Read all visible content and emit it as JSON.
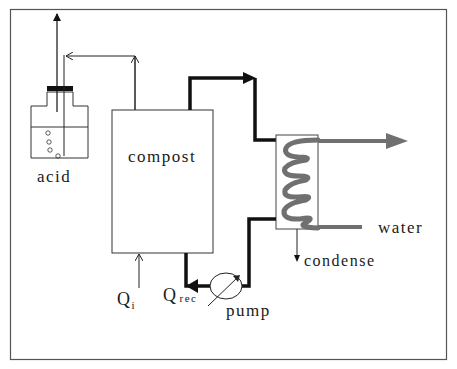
{
  "diagram": {
    "labels": {
      "acid": "acid",
      "compost": "compost",
      "water": "water",
      "condense": "condense",
      "pump": "pump",
      "q_rec_main": "Q",
      "q_rec_sub": "rec",
      "q_i_main": "Q",
      "q_i_sub": "i"
    },
    "colors": {
      "line": "#111111",
      "thin_line": "#333333",
      "coil": "#707070",
      "frame": "#555555"
    },
    "components": [
      {
        "id": "acid-trap",
        "name": "acid"
      },
      {
        "id": "compost-reactor",
        "name": "compost"
      },
      {
        "id": "condenser",
        "name": "condenser coil"
      },
      {
        "id": "pump",
        "name": "pump"
      }
    ],
    "flows": [
      {
        "from": "Q_i",
        "to": "compost-reactor"
      },
      {
        "from": "compost-reactor",
        "to": "acid-trap"
      },
      {
        "from": "acid-trap",
        "to": "exhaust"
      },
      {
        "from": "compost-reactor",
        "to": "condenser"
      },
      {
        "from": "condenser",
        "to": "condense"
      },
      {
        "from": "condenser",
        "to": "pump"
      },
      {
        "from": "pump",
        "to": "compost-reactor",
        "label": "Q_rec"
      },
      {
        "from": "water",
        "to": "condenser coil",
        "label": "water"
      }
    ]
  }
}
